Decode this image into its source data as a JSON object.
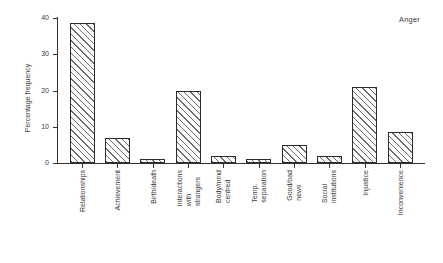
{
  "chart_data": {
    "type": "bar",
    "title": "Anger",
    "ylabel": "Percentage frequency",
    "xlabel": "",
    "ylim": [
      0,
      40
    ],
    "yticks": [
      0,
      10,
      20,
      30,
      40
    ],
    "categories": [
      "Relationships",
      "Achievement",
      "Birth/death",
      "Interactions with\nstrangers",
      "Body/mind\ncentred",
      "Temp. separation",
      "Good/bad news",
      "Social institutions",
      "Injustice",
      "Inconvenience"
    ],
    "values": [
      38.5,
      7,
      1,
      20,
      2,
      1,
      5,
      2,
      21,
      8.5
    ],
    "grid": false,
    "legend": "none",
    "bar_fill": "#ffffff",
    "bar_hatch": "diagonal-down",
    "hatch_color": "#646464",
    "outline_color": "#2b2b2b",
    "axis_color": "#333333",
    "text_color": "#3a3a3a",
    "background": "#ffffff"
  }
}
